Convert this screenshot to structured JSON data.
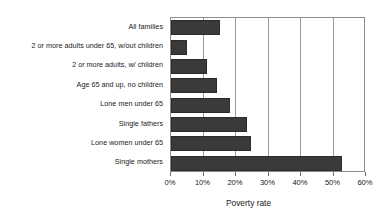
{
  "chart_data": {
    "type": "bar",
    "orientation": "horizontal",
    "title": "",
    "xlabel": "Poverty rate",
    "ylabel": "",
    "xlim": [
      0,
      60
    ],
    "grid": true,
    "legend": false,
    "bar_color": "#3a3a3a",
    "gridline_color": "#9a9a9a",
    "frame_color": "#8c8c8c",
    "background_color": "#ffffff",
    "xticks": [
      "0%",
      "10%",
      "20%",
      "30%",
      "40%",
      "50%",
      "60%"
    ],
    "xtick_values": [
      0,
      10,
      20,
      30,
      40,
      50,
      60
    ],
    "categories": [
      "All families",
      "2 or more adults under 65, w/out children",
      "2 or more adults, w/ children",
      "Age 65 and up, no children",
      "Lone men under 65",
      "Single fathers",
      "Lone women under 65",
      "Single mothers"
    ],
    "values": [
      15,
      5,
      11,
      14,
      18,
      23.5,
      24.5,
      52.5
    ],
    "value_labels": [
      "15%",
      "5%",
      "11%",
      "14%",
      "18%",
      "23.5%",
      "24.5%",
      "52.5%"
    ]
  }
}
